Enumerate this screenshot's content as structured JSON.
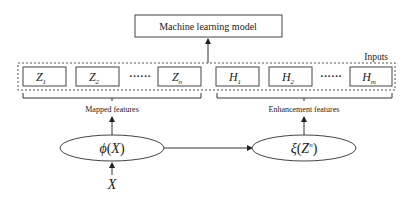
{
  "model_box": {
    "label": "Machine learning model"
  },
  "inputs_label": "Inputs",
  "mapped_nodes": [
    {
      "base": "Z",
      "sub": "1"
    },
    {
      "base": "Z",
      "sub": "2"
    },
    {
      "base": "Z",
      "sub": "n"
    }
  ],
  "enhancement_nodes": [
    {
      "base": "H",
      "sub": "1"
    },
    {
      "base": "H",
      "sub": "2"
    },
    {
      "base": "H",
      "sub": "m"
    }
  ],
  "ellipsis": "······",
  "mapped_features_label": "Mapped features",
  "enhancement_features_label": "Enhancement features",
  "phi_node": {
    "func": "ϕ",
    "open": "(",
    "arg": "X",
    "close": ")"
  },
  "xi_node": {
    "func": "ξ",
    "open": "(",
    "arg": "Z",
    "sup": "n",
    "close": ")"
  },
  "input_x": "X",
  "colors": {
    "stroke": "#333333",
    "dashed": "#555555",
    "background": "#ffffff"
  }
}
